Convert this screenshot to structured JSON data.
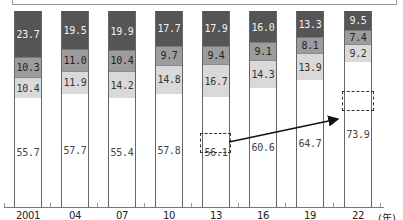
{
  "chart_data": {
    "type": "bar",
    "stacked": true,
    "normalized_percent": true,
    "title": "",
    "xlabel": "(年)",
    "ylabel": "",
    "ylim": [
      0,
      100
    ],
    "grid": false,
    "categories": [
      "2001",
      "04",
      "07",
      "10",
      "13",
      "16",
      "19",
      "22"
    ],
    "series": [
      {
        "name": "bottom (white)",
        "color": "#ffffff",
        "values": [
          55.7,
          57.7,
          55.4,
          57.8,
          56.1,
          60.6,
          64.7,
          73.9
        ]
      },
      {
        "name": "light gray",
        "color": "#d9d9d9",
        "values": [
          10.4,
          11.9,
          14.2,
          14.8,
          16.7,
          14.3,
          13.9,
          9.2
        ]
      },
      {
        "name": "mid gray",
        "color": "#9c9c9c",
        "values": [
          10.3,
          11.0,
          10.4,
          9.7,
          9.4,
          9.1,
          8.1,
          7.4
        ]
      },
      {
        "name": "dark gray",
        "color": "#555555",
        "values": [
          23.7,
          19.5,
          19.9,
          17.7,
          17.9,
          16.0,
          13.3,
          9.5
        ]
      }
    ],
    "annotations": [
      {
        "type": "dashed-box",
        "category": "13",
        "value": "56.1"
      },
      {
        "type": "dashed-box",
        "category": "22",
        "value": "73.9"
      },
      {
        "type": "arrow",
        "from": "13",
        "to": "22"
      }
    ]
  },
  "x_unit": "(年)",
  "labels": {
    "years": [
      "2001",
      "04",
      "07",
      "10",
      "13",
      "16",
      "19",
      "22"
    ],
    "bar0": [
      "55.7",
      "10.4",
      "10.3",
      "23.7"
    ],
    "bar1": [
      "57.7",
      "11.9",
      "11.0",
      "19.5"
    ],
    "bar2": [
      "55.4",
      "14.2",
      "10.4",
      "19.9"
    ],
    "bar3": [
      "57.8",
      "14.8",
      "9.7",
      "17.7"
    ],
    "bar4": [
      "56.1",
      "16.7",
      "9.4",
      "17.9"
    ],
    "bar5": [
      "60.6",
      "14.3",
      "9.1",
      "16.0"
    ],
    "bar6": [
      "64.7",
      "13.9",
      "8.1",
      "13.3"
    ],
    "bar7": [
      "73.9",
      "9.2",
      "7.4",
      "9.5"
    ]
  }
}
